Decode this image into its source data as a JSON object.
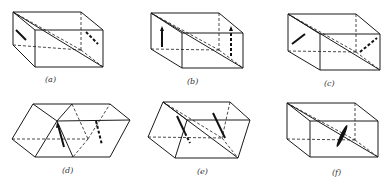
{
  "figure": {
    "panels": [
      {
        "id": "a",
        "label": "(a)",
        "description": "rectangular prism with diagonal plane, dislocation arrows parallel on left and right faces"
      },
      {
        "id": "b",
        "label": "(b)",
        "description": "rectangular prism with diagonal plane, vertical double-headed arrows"
      },
      {
        "id": "c",
        "label": "(c)",
        "description": "rectangular prism with diagonal plane, inclined arrows"
      },
      {
        "id": "d",
        "label": "(d)",
        "description": "sheared prism (parallelepipeds) with arrows"
      },
      {
        "id": "e",
        "label": "(e)",
        "description": "sheared prism with diagonal plane and inclined arrows"
      },
      {
        "id": "f",
        "label": "(f)",
        "description": "rectangular prism with diagonal plane and single lens-shaped mark"
      }
    ]
  },
  "colors": {
    "line": "#1a1a1a",
    "background": "#ffffff"
  }
}
